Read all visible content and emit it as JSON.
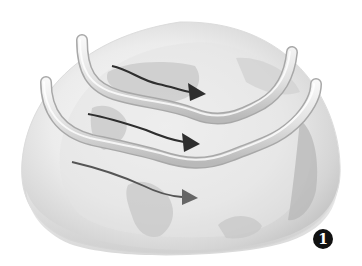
{
  "diagram": {
    "badge": {
      "label": "1"
    },
    "colors": {
      "background": "#ffffff",
      "globe_light": "#f4f4f4",
      "globe_mid": "#d9d9d9",
      "globe_dark": "#b5b5b5",
      "land": "#c8c8c8",
      "tube_fill": "#e6e6e6",
      "tube_edge": "#a8a8a8",
      "arrow": "#2e2e2e",
      "arrow_faint": "#555555",
      "badge": "#111111"
    },
    "elements": [
      {
        "type": "tube",
        "name": "upper-jet-stream-tube"
      },
      {
        "type": "tube",
        "name": "lower-jet-stream-tube"
      },
      {
        "type": "arrow",
        "name": "wind-arrow-top"
      },
      {
        "type": "arrow",
        "name": "wind-arrow-middle"
      },
      {
        "type": "arrow",
        "name": "wind-arrow-bottom"
      }
    ]
  }
}
